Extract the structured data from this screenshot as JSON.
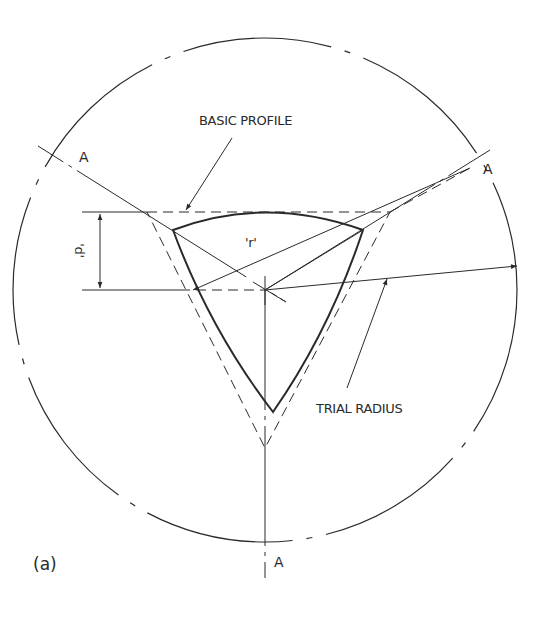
{
  "figure": {
    "label": "(a)",
    "annotations": {
      "basic_profile": "BASIC PROFILE",
      "trial_radius": "TRIAL RADIUS",
      "d_dimension": "'d'",
      "r_label": "'r'",
      "section_marks": [
        "A",
        "A",
        "A"
      ]
    },
    "colors": {
      "line": "#2a2a2a",
      "background": "#ffffff"
    }
  }
}
